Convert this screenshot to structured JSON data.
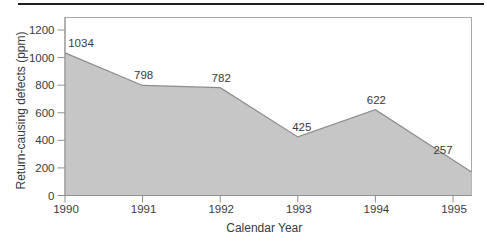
{
  "chart_data": {
    "type": "area",
    "title": "",
    "xlabel": "Calendar Year",
    "ylabel": "Return-causing defects (ppm)",
    "categories": [
      "1990",
      "1991",
      "1992",
      "1993",
      "1994",
      "1995"
    ],
    "values": [
      1034,
      798,
      782,
      425,
      622,
      257
    ],
    "point_labels": [
      "1034",
      "798",
      "782",
      "425",
      "622",
      "257"
    ],
    "series": [
      {
        "name": "Return-causing defects",
        "values": [
          1034,
          798,
          782,
          425,
          622,
          257
        ]
      }
    ],
    "y_ticks": [
      0,
      200,
      400,
      600,
      800,
      1000,
      1200
    ],
    "ylim": [
      0,
      1290
    ],
    "grid": false,
    "legend_position": "none",
    "colors": {
      "area_fill": "#c6c6c6",
      "area_edge": "#8c8c8c",
      "plot_border": "#a8a8a8",
      "tick": "#8f8f8f",
      "text": "#3a3a3a",
      "top_rule": "#1f1f1f",
      "background": "#ffffff"
    }
  }
}
